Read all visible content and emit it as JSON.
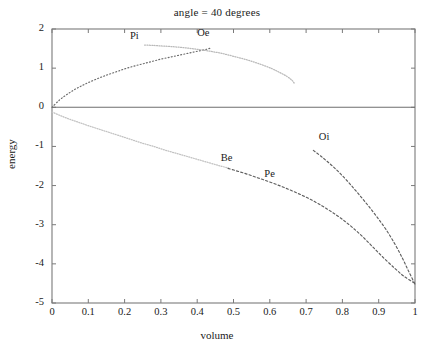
{
  "chart_data": {
    "type": "line",
    "title": "angle = 40 degrees",
    "xlabel": "volume",
    "ylabel": "energy",
    "xlim": [
      0,
      1
    ],
    "ylim": [
      -5,
      2
    ],
    "grid": false,
    "legend": "inline-curve-labels",
    "xticks": [
      "0",
      "0.1",
      "0.2",
      "0.3",
      "0.4",
      "0.5",
      "0.6",
      "0.7",
      "0.8",
      "0.9",
      "1"
    ],
    "xtick_values": [
      0,
      0.1,
      0.2,
      0.3,
      0.4,
      0.5,
      0.6,
      0.7,
      0.8,
      0.9,
      1
    ],
    "yticks": [
      "2",
      "1",
      "0",
      "-1",
      "-2",
      "-3",
      "-4",
      "-5"
    ],
    "ytick_values": [
      2,
      1,
      0,
      -1,
      -2,
      -3,
      -4,
      -5
    ],
    "zero_line": 0,
    "series": [
      {
        "name": "Oe",
        "label": "Oe",
        "style": "dash-dot",
        "color": "#6b6b6b",
        "label_x": 0.4,
        "label_y": 1.88,
        "points": [
          [
            0.0,
            0.0
          ],
          [
            0.02,
            0.18
          ],
          [
            0.04,
            0.32
          ],
          [
            0.06,
            0.44
          ],
          [
            0.08,
            0.54
          ],
          [
            0.1,
            0.63
          ],
          [
            0.125,
            0.73
          ],
          [
            0.15,
            0.82
          ],
          [
            0.175,
            0.9
          ],
          [
            0.2,
            0.98
          ],
          [
            0.225,
            1.05
          ],
          [
            0.25,
            1.11
          ],
          [
            0.275,
            1.17
          ],
          [
            0.3,
            1.23
          ],
          [
            0.325,
            1.28
          ],
          [
            0.35,
            1.33
          ],
          [
            0.375,
            1.38
          ],
          [
            0.4,
            1.43
          ],
          [
            0.425,
            1.48
          ],
          [
            0.44,
            1.52
          ]
        ]
      },
      {
        "name": "Pi",
        "label": "Pi",
        "style": "fine-dotted",
        "color": "#b9b9b9",
        "label_x": 0.215,
        "label_y": 1.8,
        "points": [
          [
            0.255,
            1.59
          ],
          [
            0.28,
            1.58
          ],
          [
            0.305,
            1.565
          ],
          [
            0.33,
            1.55
          ],
          [
            0.355,
            1.53
          ],
          [
            0.38,
            1.505
          ],
          [
            0.405,
            1.475
          ],
          [
            0.43,
            1.44
          ],
          [
            0.455,
            1.4
          ],
          [
            0.48,
            1.35
          ],
          [
            0.505,
            1.29
          ],
          [
            0.53,
            1.23
          ],
          [
            0.555,
            1.16
          ],
          [
            0.58,
            1.08
          ],
          [
            0.605,
            0.99
          ],
          [
            0.625,
            0.9
          ],
          [
            0.645,
            0.8
          ],
          [
            0.66,
            0.7
          ],
          [
            0.667,
            0.62
          ]
        ]
      },
      {
        "name": "Be",
        "label": "Be",
        "style": "fine-dotted",
        "color": "#c2c2c2",
        "label_x": 0.465,
        "label_y": -1.32,
        "points": [
          [
            0.0,
            -0.12
          ],
          [
            0.025,
            -0.22
          ],
          [
            0.05,
            -0.31
          ],
          [
            0.075,
            -0.39
          ],
          [
            0.1,
            -0.47
          ],
          [
            0.13,
            -0.56
          ],
          [
            0.16,
            -0.65
          ],
          [
            0.19,
            -0.74
          ],
          [
            0.22,
            -0.83
          ],
          [
            0.25,
            -0.92
          ],
          [
            0.28,
            -1.0
          ],
          [
            0.31,
            -1.09
          ],
          [
            0.34,
            -1.17
          ],
          [
            0.37,
            -1.25
          ],
          [
            0.4,
            -1.33
          ],
          [
            0.43,
            -1.41
          ],
          [
            0.46,
            -1.49
          ],
          [
            0.485,
            -1.55
          ]
        ]
      },
      {
        "name": "Pe",
        "label": "Pe",
        "style": "dashed",
        "color": "#5f5f5f",
        "label_x": 0.585,
        "label_y": -1.73,
        "points": [
          [
            0.485,
            -1.56
          ],
          [
            0.51,
            -1.63
          ],
          [
            0.535,
            -1.7
          ],
          [
            0.56,
            -1.78
          ],
          [
            0.585,
            -1.86
          ],
          [
            0.615,
            -1.96
          ],
          [
            0.645,
            -2.07
          ],
          [
            0.675,
            -2.19
          ],
          [
            0.705,
            -2.32
          ],
          [
            0.735,
            -2.47
          ],
          [
            0.765,
            -2.64
          ],
          [
            0.795,
            -2.83
          ],
          [
            0.825,
            -3.05
          ],
          [
            0.855,
            -3.3
          ],
          [
            0.885,
            -3.58
          ],
          [
            0.915,
            -3.86
          ],
          [
            0.945,
            -4.12
          ],
          [
            0.97,
            -4.32
          ],
          [
            1.0,
            -4.5
          ]
        ]
      },
      {
        "name": "Oi",
        "label": "Oi",
        "style": "dashed",
        "color": "#5f5f5f",
        "label_x": 0.735,
        "label_y": -0.78,
        "points": [
          [
            0.72,
            -1.1
          ],
          [
            0.745,
            -1.28
          ],
          [
            0.77,
            -1.48
          ],
          [
            0.795,
            -1.7
          ],
          [
            0.82,
            -1.95
          ],
          [
            0.845,
            -2.22
          ],
          [
            0.87,
            -2.5
          ],
          [
            0.895,
            -2.8
          ],
          [
            0.92,
            -3.12
          ],
          [
            0.945,
            -3.5
          ],
          [
            0.965,
            -3.85
          ],
          [
            0.982,
            -4.18
          ],
          [
            1.0,
            -4.52
          ]
        ]
      }
    ]
  }
}
